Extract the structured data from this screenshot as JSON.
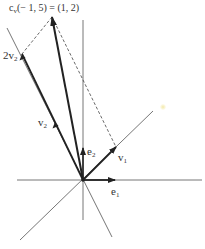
{
  "figure": {
    "title": {
      "prefix": "c",
      "subscript": "v",
      "text": "(− 1, 5) = (1, 2)"
    },
    "labels": {
      "two_v2": {
        "main": "2v",
        "sub": "2"
      },
      "v2": {
        "main": "v",
        "sub": "2"
      },
      "e2": {
        "main": "e",
        "sub": "2"
      },
      "v1": {
        "main": "v",
        "sub": "1"
      },
      "e1": {
        "main": "e",
        "sub": "1"
      }
    },
    "colors": {
      "axis": "#555555",
      "vector": "#222222",
      "dashed": "#444444",
      "background": "#ffffff"
    },
    "geometry": {
      "origin": [
        83,
        180
      ],
      "x_axis": [
        [
          17,
          180
        ],
        [
          202,
          180
        ]
      ],
      "y_axis": [
        [
          83,
          20
        ],
        [
          83,
          220
        ]
      ],
      "v1_line": [
        [
          20,
          240
        ],
        [
          153,
          111
        ]
      ],
      "v2_line": [
        [
          112,
          237
        ],
        [
          7,
          28
        ]
      ],
      "e1_tip": [
        115,
        180
      ],
      "e2_tip": [
        83,
        148
      ],
      "v1_tip": [
        116,
        147
      ],
      "v2_point": [
        55,
        122
      ],
      "two_v2_point": [
        22,
        54
      ],
      "result_tip": [
        52,
        17
      ]
    }
  }
}
